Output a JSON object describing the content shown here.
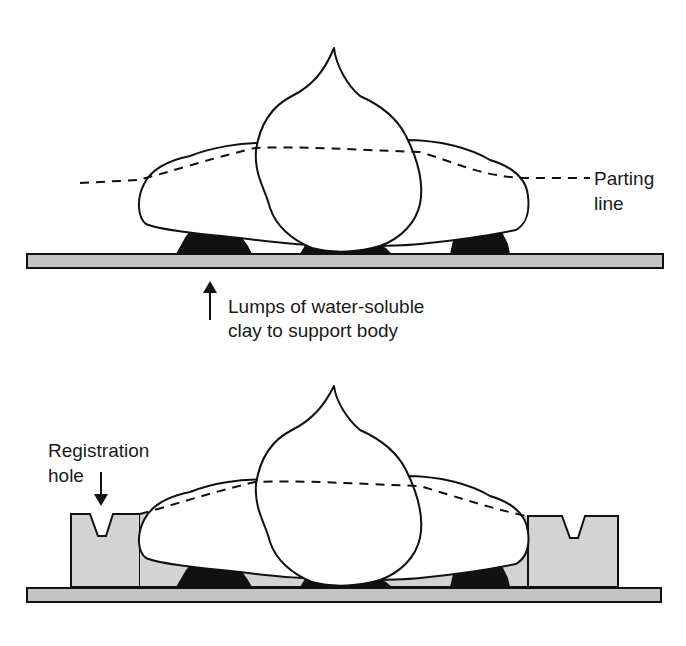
{
  "figure": {
    "top_stage": {
      "labels": {
        "parting_line_1": "Parting",
        "parting_line_2": "line",
        "lumps_1": "Lumps of water-soluble",
        "lumps_2": "clay to support body"
      }
    },
    "bottom_stage": {
      "labels": {
        "registration_1": "Registration",
        "registration_2": "hole"
      }
    },
    "colors": {
      "outline": "#111111",
      "board": "#c4c4c4",
      "clay_bed": "#d3d3d3",
      "clay_lumps": "#111111",
      "background": "#ffffff"
    }
  }
}
